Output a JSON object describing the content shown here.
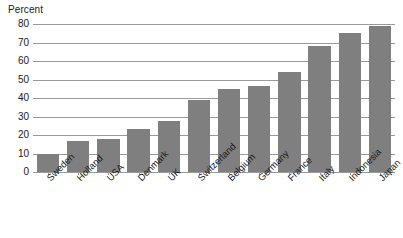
{
  "chart_data": {
    "type": "bar",
    "title": "",
    "xlabel": "",
    "ylabel": "Percent",
    "ylim": [
      0,
      80
    ],
    "yticks": [
      0,
      10,
      20,
      30,
      40,
      50,
      60,
      70,
      80
    ],
    "grid": true,
    "legend": false,
    "orientation": "vertical",
    "bar_color": "#7f7f7f",
    "categories": [
      "Sweden",
      "Holland",
      "USA",
      "Denmark",
      "UK",
      "Switzerland",
      "Belgium",
      "Germany",
      "France",
      "Italy",
      "Indonesia",
      "Japan"
    ],
    "values": [
      10,
      17,
      18,
      23,
      27.5,
      39,
      45,
      46.5,
      54,
      68,
      75,
      79
    ]
  }
}
